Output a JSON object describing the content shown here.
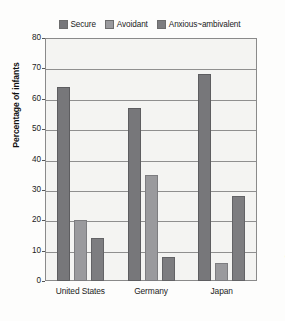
{
  "chart_data": {
    "type": "bar",
    "title": "",
    "xlabel": "",
    "ylabel": "Percentage of infants",
    "ylim": [
      0,
      80
    ],
    "ytick_step": 10,
    "ytick_labels": [
      "0",
      "10",
      "20",
      "30",
      "40",
      "50",
      "60",
      "70",
      "80"
    ],
    "grid": true,
    "legend_position": "top-center",
    "categories": [
      "United States",
      "Germany",
      "Japan"
    ],
    "series": [
      {
        "name": "Secure",
        "values": [
          64,
          57,
          68
        ],
        "color": "#77777a"
      },
      {
        "name": "Avoidant",
        "values": [
          20,
          35,
          6
        ],
        "color": "#9a9a9d"
      },
      {
        "name": "Anxious~ambivalent",
        "values": [
          14,
          8,
          28
        ],
        "color": "#7d7d80"
      }
    ]
  },
  "credit": "© 2017 Cengage Learning"
}
